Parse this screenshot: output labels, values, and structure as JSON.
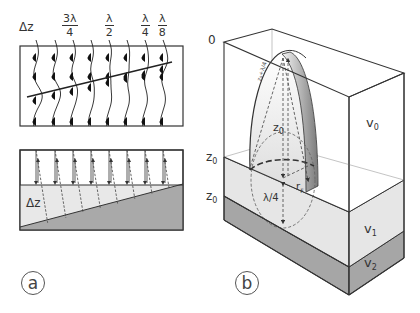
{
  "panel_a": {
    "tag": "a",
    "top_labels": [
      {
        "type": "text",
        "text": "Δz",
        "x": 19,
        "y": 21
      },
      {
        "type": "frac",
        "num": "3λ",
        "den": "4",
        "x": 62,
        "y": 13
      },
      {
        "type": "frac",
        "num": "λ",
        "den": "2",
        "x": 105,
        "y": 13
      },
      {
        "type": "frac",
        "num": "λ",
        "den": "4",
        "x": 141,
        "y": 13
      },
      {
        "type": "frac",
        "num": "λ",
        "den": "8",
        "x": 158,
        "y": 13
      }
    ],
    "wavelet_box": {
      "x": 20,
      "y": 46,
      "w": 163,
      "h": 80
    },
    "trace_x": [
      36,
      55,
      73,
      91,
      109,
      127,
      145,
      163
    ],
    "dipping_line": {
      "x1": 27,
      "y1": 97,
      "x2": 172,
      "y2": 62
    },
    "wedge_box": {
      "x": 20,
      "y": 150,
      "w": 163,
      "h": 80,
      "interface_y": 185,
      "wedge_left_y": 227,
      "wedge_right_y": 184
    },
    "wedge_label": "Δz",
    "colors": {
      "layer1": "#e8e8e8",
      "layer2": "#a9a9a9",
      "ink": "#222222"
    }
  },
  "panel_b": {
    "tag": "b",
    "labels": {
      "top_zero": "0",
      "z0_upper": "z",
      "z0_upper_sub": "0",
      "z0_lower": "z",
      "z0_lower_sub": "0",
      "v0": "v",
      "v0_sub": "0",
      "v1": "v",
      "v1_sub": "1",
      "v2": "v",
      "v2_sub": "2",
      "z0_inner": "z",
      "z0_inner_sub": "0",
      "lambda_quarter": "λ/4",
      "fresnel_radius": "r",
      "fresnel_radius_sub": "F",
      "slant_path": "z₀+λ/4"
    },
    "colors": {
      "layer0": "#ffffff",
      "layer1": "#e6e6e6",
      "layer2": "#a6a6a6",
      "ink": "#222222",
      "dash": "#555555"
    }
  }
}
